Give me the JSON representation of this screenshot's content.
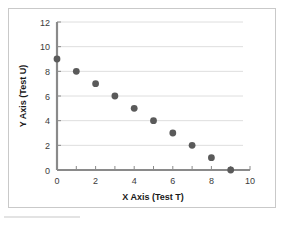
{
  "chart_data": {
    "type": "scatter",
    "title": "",
    "xlabel": "X Axis (Test T)",
    "ylabel": "Y Axis (Test U)",
    "x": [
      0,
      1,
      2,
      3,
      4,
      5,
      6,
      7,
      8,
      9
    ],
    "y": [
      9,
      8,
      7,
      6,
      5,
      4,
      3,
      2,
      1,
      0
    ],
    "points": [
      {
        "x": 0,
        "y": 9
      },
      {
        "x": 1,
        "y": 8
      },
      {
        "x": 2,
        "y": 7
      },
      {
        "x": 3,
        "y": 6
      },
      {
        "x": 4,
        "y": 5
      },
      {
        "x": 5,
        "y": 4
      },
      {
        "x": 6,
        "y": 3
      },
      {
        "x": 7,
        "y": 2
      },
      {
        "x": 8,
        "y": 1
      },
      {
        "x": 9,
        "y": 0
      }
    ],
    "xlim": [
      0,
      10
    ],
    "ylim": [
      0,
      12
    ],
    "xticks": [
      0,
      1,
      2,
      3,
      4,
      5,
      6,
      7,
      8,
      9,
      10
    ],
    "xtick_labels": [
      "0",
      "",
      "2",
      "",
      "4",
      "",
      "6",
      "",
      "8",
      "",
      "10"
    ],
    "yticks": [
      0,
      2,
      4,
      6,
      8,
      10,
      12
    ],
    "ytick_labels": [
      "0",
      "2",
      "4",
      "6",
      "8",
      "10",
      "12"
    ],
    "grid": "horizontal",
    "legend": "none",
    "marker_color": "#5a5a5a",
    "grid_color": "#dedede",
    "axis_color": "#8a8a8a",
    "frame_color": "#c9c9c9"
  }
}
